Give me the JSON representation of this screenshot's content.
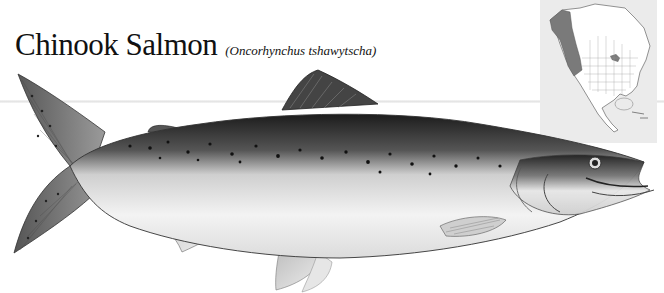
{
  "title": {
    "common_name": "Chinook Salmon",
    "scientific_name": "(Oncorhynchus tshawytscha)"
  },
  "range_map": {
    "region": "North America",
    "highlight_color": "#7a7a7a",
    "background_color": "#ebebeb"
  },
  "illustration": {
    "subject": "Chinook salmon, side view",
    "style": "grayscale print illustration"
  }
}
